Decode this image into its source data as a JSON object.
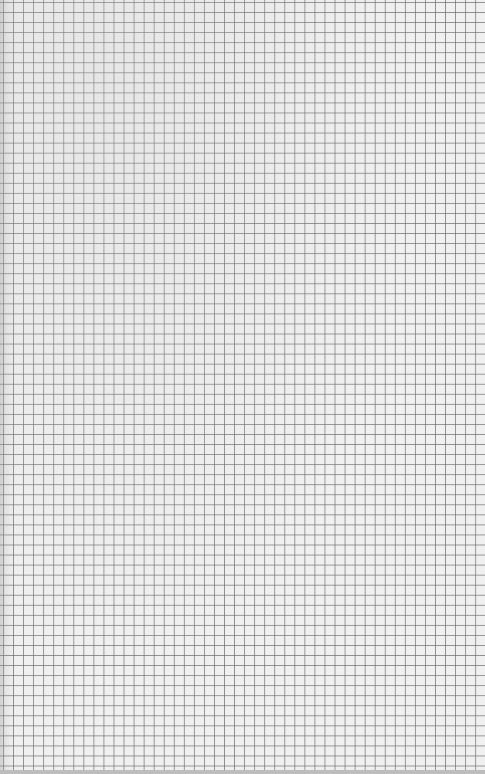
{
  "page": {
    "type": "graph-paper-scan",
    "grid": {
      "cell_size_px": 10,
      "line_color": "#6e6e6e",
      "background_color": "#f0f0f0"
    }
  }
}
